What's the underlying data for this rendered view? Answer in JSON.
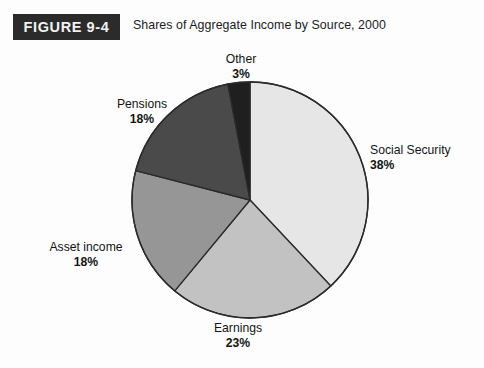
{
  "header": {
    "figure_badge": "FIGURE 9-4",
    "title": "Shares of Aggregate Income by Source, 2000"
  },
  "chart_data": {
    "type": "pie",
    "title": "Shares of Aggregate Income by Source, 2000",
    "figure_number": "FIGURE 9-4",
    "unit": "percent",
    "legend": "none",
    "labels_position": "outside-callout",
    "grid": false,
    "start_angle_deg": 0,
    "direction": "clockwise",
    "categories": [
      "Social Security",
      "Earnings",
      "Asset income",
      "Pensions",
      "Other"
    ],
    "values": [
      38,
      23,
      18,
      18,
      3
    ],
    "value_labels": [
      "38%",
      "23%",
      "18%",
      "18%",
      "3%"
    ],
    "colors": [
      "#e6e6e6",
      "#c2c2c2",
      "#969696",
      "#4a4a4a",
      "#1f1f1f"
    ],
    "slices": [
      {
        "label": "Social Security",
        "value": 38,
        "value_label": "38%",
        "color": "#e6e6e6"
      },
      {
        "label": "Earnings",
        "value": 23,
        "value_label": "23%",
        "color": "#c2c2c2"
      },
      {
        "label": "Asset income",
        "value": 18,
        "value_label": "18%",
        "color": "#969696"
      },
      {
        "label": "Pensions",
        "value": 18,
        "value_label": "18%",
        "color": "#4a4a4a"
      },
      {
        "label": "Other",
        "value": 3,
        "value_label": "3%",
        "color": "#1f1f1f"
      }
    ]
  },
  "colors": {
    "badge_background": "#2b2b2b",
    "badge_text": "#f2f2f2",
    "page_background": "#fdfdfd",
    "slice_outline": "#2a2a2a",
    "text": "#141414"
  }
}
